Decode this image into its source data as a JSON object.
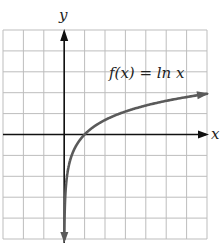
{
  "chart_data": {
    "type": "line",
    "title": "",
    "xlabel": "x",
    "ylabel": "y",
    "xlim": [
      -3,
      7
    ],
    "ylim": [
      -5,
      5
    ],
    "grid": true,
    "grid_step": 1,
    "legend": null,
    "annotations": [
      {
        "text": "f(x) = ln x",
        "position": "upper-right, above curve near x=2..6"
      }
    ],
    "series": [
      {
        "name": "f(x) = ln x",
        "function": "ln x",
        "arrows": "both ends",
        "x": [
          0.0067,
          0.02,
          0.05,
          0.1,
          0.2,
          0.3,
          0.5,
          0.75,
          1,
          1.5,
          2,
          3,
          4,
          5,
          6,
          7
        ],
        "values": [
          -5.0,
          -3.91,
          -3.0,
          -2.3,
          -1.61,
          -1.2,
          -0.69,
          -0.29,
          0.0,
          0.41,
          0.69,
          1.1,
          1.39,
          1.61,
          1.79,
          1.95
        ]
      }
    ]
  },
  "graph": {
    "x_axis_label": "x",
    "y_axis_label": "y",
    "function_label": "f(x) = ln x",
    "colors": {
      "grid": "#bdbdbd",
      "axes": "#111111",
      "curve": "#5a5a5a",
      "text": "#222222"
    }
  }
}
